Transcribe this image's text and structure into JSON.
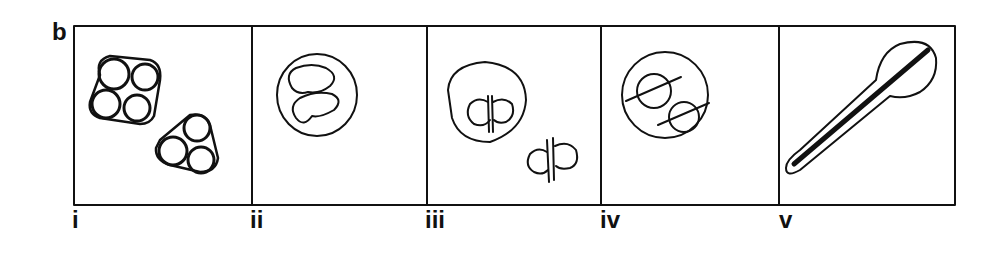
{
  "figure": {
    "panel_letter": "b",
    "stroke_color": "#111111",
    "background": "#ffffff",
    "subpanels": [
      {
        "label": "i",
        "description": "two clusters of tightly packed circles (tetrad of four and triad of three) enclosed by outlines"
      },
      {
        "label": "ii",
        "description": "round cell containing two curved kidney-shaped bodies"
      },
      {
        "label": "iii",
        "description": "cell with a dividing pair of lobes separated by double line, plus a free dividing pair outside"
      },
      {
        "label": "iv",
        "description": "round cell containing two small circles each crossed by a diagonal line"
      },
      {
        "label": "v",
        "description": "elongated club-shaped outline with a dark central streak running diagonally"
      }
    ]
  }
}
